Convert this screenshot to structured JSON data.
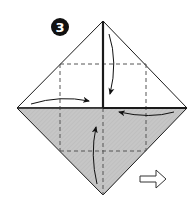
{
  "step": {
    "number": "3"
  },
  "colors": {
    "background": "#ffffff",
    "paper_white": "#ffffff",
    "paper_colored": "#c6c6c6",
    "line": "#1a1a1a",
    "dashed": "#555555",
    "badge": "#111111"
  },
  "icons": {
    "step_badge": "number-3-circle",
    "next_arrow": "hollow-right-arrow",
    "fold_arrows": [
      "curved-arrow-right",
      "curved-arrow-left",
      "curved-arrow-down",
      "curved-arrow-up"
    ]
  }
}
